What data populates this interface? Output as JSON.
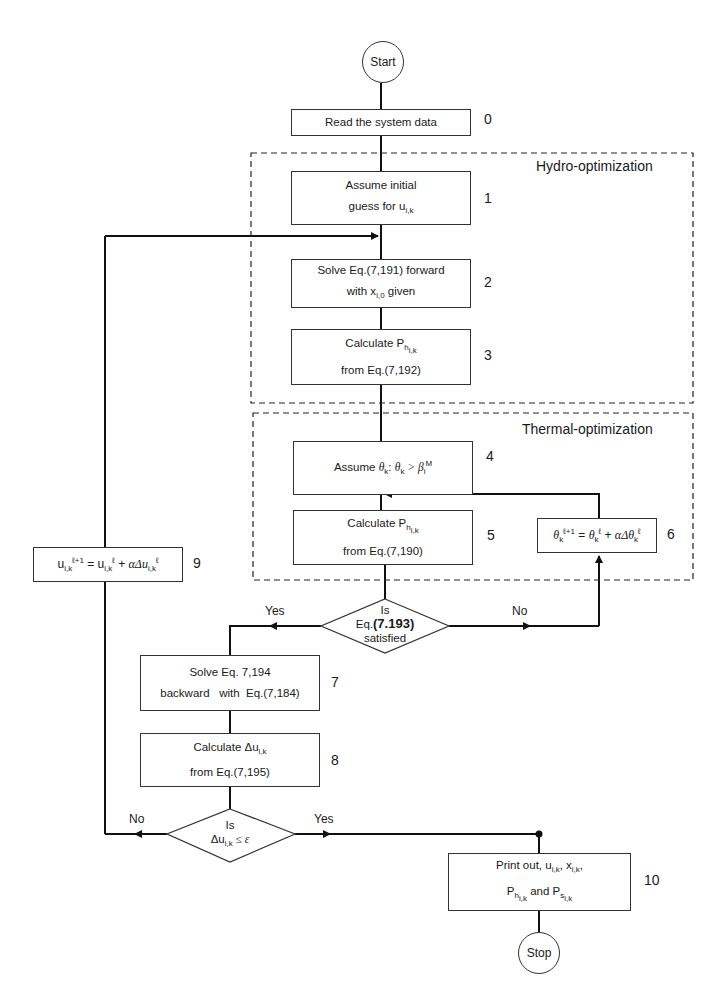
{
  "start": {
    "label": "Start"
  },
  "stop": {
    "label": "Stop"
  },
  "regions": {
    "hydro": {
      "title": "Hydro-optimization"
    },
    "thermal": {
      "title": "Thermal-optimization"
    }
  },
  "steps": [
    {
      "num": "0",
      "line1": "Read the system data"
    },
    {
      "num": "1",
      "line1": "Assume initial",
      "line2": "guess for u",
      "line2_sub": "i,k"
    },
    {
      "num": "2",
      "line1": "Solve Eq.(7,191) forward",
      "line2a": "with  x",
      "line2_sub": "i,0",
      "line2b": " given"
    },
    {
      "num": "3",
      "line1": "Calculate P",
      "line1_sub": "h",
      "line1_subsub": "i,k",
      "line2": "from Eq.(7,192)"
    },
    {
      "num": "4",
      "line1a": "Assume ",
      "theta": "θ",
      "k": "k",
      "mid": ": ",
      "cond": " > β",
      "cond_sub": "i",
      "cond_sup": "M"
    },
    {
      "num": "5",
      "line1": "Calculate P",
      "line1_sub": "h",
      "line1_subsub": "i,k",
      "line2": "from Eq.(7,190)"
    },
    {
      "num": "6",
      "formula": "θ_k^(ℓ+1) = θ_k^ℓ + αΔθ_k^ℓ",
      "theta": "θ",
      "k": "k",
      "sup_next": "ℓ+1",
      "sup": "ℓ",
      "eq": " = ",
      "plus": " + ",
      "alpha_delta": "αΔθ"
    },
    {
      "num": "7",
      "line1": "Solve Eq. 7,194",
      "line2": "backward   with  Eq.(7,184)"
    },
    {
      "num": "8",
      "line1": "Calculate Δu",
      "line1_sub": "i,k",
      "line2": "from Eq.(7,195)"
    },
    {
      "num": "9",
      "formula": "u_i,k^(ℓ+1) = u_i,k^ℓ + αΔu_i,k^ℓ",
      "u": "u",
      "sub": "i,k",
      "sup_next": "ℓ+1",
      "sup": "ℓ",
      "eq": " = ",
      "plus": " + ",
      "alpha_delta": "αΔu"
    },
    {
      "num": "10",
      "line1a": "Print out, u",
      "sub1": "i,k",
      "line1b": ", x",
      "sub2": "i,k",
      "line1c": ",",
      "line2a": "P",
      "sub3": "h",
      "sub3s": "i,k",
      "line2b": " and P",
      "sub4": "s",
      "sub4s": "i,k"
    }
  ],
  "decisions": [
    {
      "line1": "Is",
      "line2a": "Eq.",
      "line2b": "(7.193)",
      "line3": "satisfied",
      "yes": "Yes",
      "no": "No"
    },
    {
      "line1": "Is",
      "line2a": "Δu",
      "sub": "i,k",
      "line2b": " ≤ ε",
      "yes": "Yes",
      "no": "No"
    }
  ]
}
